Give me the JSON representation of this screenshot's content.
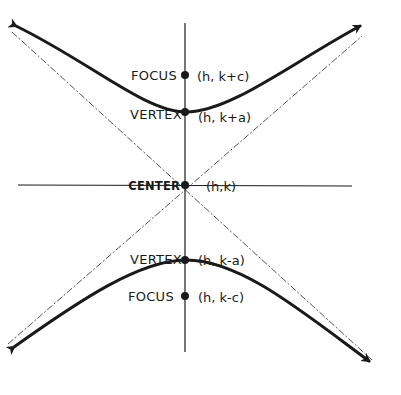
{
  "diagram": {
    "type": "vertical-hyperbola",
    "colors": {
      "ink": "#1a1a1a",
      "background": "#ffffff",
      "asymptote": "#555555"
    },
    "center": {
      "label": "CENTER",
      "coord": "(h,k)"
    },
    "upper_focus": {
      "label": "FOCUS",
      "coord": "(h, k+c)"
    },
    "upper_vertex": {
      "label": "VERTEX",
      "coord": "(h, k+a)"
    },
    "lower_vertex": {
      "label": "VERTEX",
      "coord": "(h, k-a)"
    },
    "lower_focus": {
      "label": "FOCUS",
      "coord": "(h, k-c)"
    },
    "elements": [
      "transverse-axis (vertical)",
      "conjugate-axis (horizontal)",
      "asymptote (dashed, positive slope)",
      "asymptote (dashed, negative slope)",
      "upper branch with arrows",
      "lower branch with arrows"
    ]
  }
}
